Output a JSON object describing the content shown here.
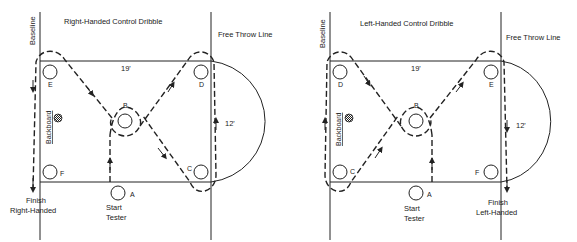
{
  "diagrams": [
    {
      "title": "Right-Handed Control Dribble",
      "baseline_label": "Baseline",
      "free_throw_label": "Free Throw Line",
      "backboard_label": "Backboard",
      "width_label": "19'",
      "height_label": "12'",
      "cones": {
        "top_left": "E",
        "top_right": "D",
        "center": "B",
        "bottom_right": "C",
        "bottom_left": "F",
        "start": "A"
      },
      "start_label_1": "Start",
      "start_label_2": "Tester",
      "finish_label_1": "Finish",
      "finish_label_2": "Right-Handed"
    },
    {
      "title": "Left-Handed Control Dribble",
      "baseline_label": "Baseline",
      "free_throw_label": "Free Throw Line",
      "backboard_label": "Backboard",
      "width_label": "19'",
      "height_label": "12'",
      "cones": {
        "top_left": "D",
        "top_right": "E",
        "center": "B",
        "bottom_right": "F",
        "bottom_left": "C",
        "start": "A"
      },
      "start_label_1": "Start",
      "start_label_2": "Tester",
      "finish_label_1": "Finish",
      "finish_label_2": "Left-Handed"
    }
  ]
}
